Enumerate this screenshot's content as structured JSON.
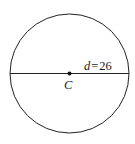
{
  "diagram": {
    "type": "circle-with-diameter",
    "center_label": "C",
    "diameter_label": {
      "variable": "d",
      "equals": "=",
      "value": "26"
    },
    "colors": {
      "stroke": "#222222",
      "background": "#ffffff"
    }
  }
}
